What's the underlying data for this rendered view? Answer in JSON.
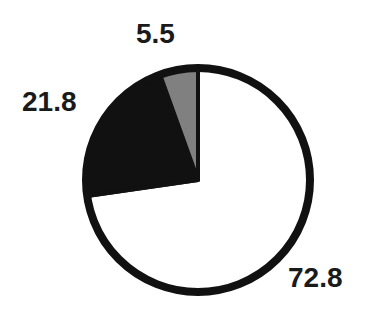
{
  "chart_data": {
    "type": "pie",
    "title": "",
    "categories": [
      "white",
      "black",
      "gray"
    ],
    "values": [
      72.8,
      21.8,
      5.5
    ],
    "colors": [
      "#ffffff",
      "#111111",
      "#808080"
    ],
    "labels": [
      "72.8",
      "21.8",
      "5.5"
    ],
    "start_angle_deg": 90,
    "direction": "clockwise",
    "legend": null
  },
  "labels": {
    "a": "5.5",
    "b": "21.8",
    "c": "72.8"
  }
}
